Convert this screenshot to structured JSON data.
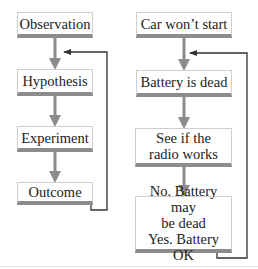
{
  "diagram": {
    "type": "flowchart",
    "columns": [
      {
        "id": "scientific-method",
        "steps": [
          {
            "label": "Observation"
          },
          {
            "label": "Hypothesis"
          },
          {
            "label": "Experiment"
          },
          {
            "label": "Outcome"
          }
        ],
        "feedback": {
          "from": "Outcome",
          "to_between": [
            "Observation",
            "Hypothesis"
          ]
        }
      },
      {
        "id": "car-example",
        "steps": [
          {
            "label": "Car won’t start"
          },
          {
            "label": "Battery is dead"
          },
          {
            "label": "See if the\nradio works"
          },
          {
            "label": "No. Battery may\nbe dead\nYes. Battery OK"
          }
        ],
        "feedback": {
          "from": "No. Battery may be dead / Yes. Battery OK",
          "to_between": [
            "Car won’t start",
            "Battery is dead"
          ]
        }
      }
    ],
    "colors": {
      "box_border": "#cfcfcf",
      "box_bar": "#8c8c8c",
      "flow_arrow": "#8c8c8c",
      "feedback_line": "#333333"
    }
  }
}
